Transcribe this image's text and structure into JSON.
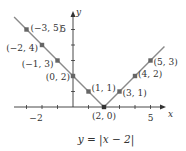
{
  "chart_data": {
    "type": "line",
    "title": "",
    "caption": "y = |x − 2|",
    "xlabel": "x",
    "ylabel": "y",
    "x_ticks_labeled": [
      "−2",
      "5"
    ],
    "y_ticks_labeled": [
      "5"
    ],
    "xlim": [
      -4.5,
      6.8
    ],
    "ylim": [
      0,
      6.2
    ],
    "grid": false,
    "series": [
      {
        "name": "y = |x - 2|",
        "color": "#888888",
        "points": [
          {
            "x": -3,
            "y": 5,
            "label": "(−3, 5)"
          },
          {
            "x": -2,
            "y": 4,
            "label": "(−2, 4)"
          },
          {
            "x": -1,
            "y": 3,
            "label": "(−1, 3)"
          },
          {
            "x": 0,
            "y": 2,
            "label": "(0, 2)"
          },
          {
            "x": 1,
            "y": 1,
            "label": "(1, 1)"
          },
          {
            "x": 2,
            "y": 0,
            "label": "(2, 0)"
          },
          {
            "x": 3,
            "y": 1,
            "label": "(3, 1)"
          },
          {
            "x": 4,
            "y": 2,
            "label": "(4, 2)"
          },
          {
            "x": 5,
            "y": 3,
            "label": "(5, 3)"
          }
        ]
      }
    ]
  },
  "colors": {
    "line": "#8a8a8a",
    "point": "#666666",
    "axis": "#333333"
  }
}
